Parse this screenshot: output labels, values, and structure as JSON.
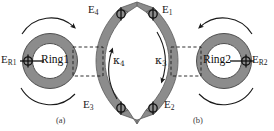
{
  "figure": {
    "background_color": "#ffffff",
    "ring_fill_color": "#8c8c8c",
    "ring_edge_color": "#4a4a4a",
    "waveguide_fill_color": "#8c8c8c",
    "arrow_color": "#1a1a1a",
    "dash_color": "#1a1a1a",
    "marker_color": "#111111"
  },
  "panels": [
    {
      "id": "a",
      "caption": "(a)",
      "ring_label": "Ring1",
      "ring_side": "left",
      "waveguide_side": "right",
      "labels": {
        "reflection_port": {
          "base": "E",
          "sub": "R1",
          "text": "E R1"
        },
        "top_port": {
          "base": "E",
          "sub": "4",
          "text": "E 4"
        },
        "bottom_port": {
          "base": "E",
          "sub": "3",
          "text": "E 3"
        },
        "coupling": {
          "base": "κ",
          "sub": "4",
          "text": "κ 4"
        }
      }
    },
    {
      "id": "b",
      "caption": "(b)",
      "ring_label": "Ring2",
      "ring_side": "right",
      "waveguide_side": "left",
      "labels": {
        "reflection_port": {
          "base": "E",
          "sub": "R2",
          "text": "E R2"
        },
        "top_port": {
          "base": "E",
          "sub": "1",
          "text": "E 1"
        },
        "bottom_port": {
          "base": "E",
          "sub": "2",
          "text": "E 2"
        },
        "coupling": {
          "base": "κ",
          "sub": "3",
          "text": "κ 3"
        }
      }
    }
  ]
}
